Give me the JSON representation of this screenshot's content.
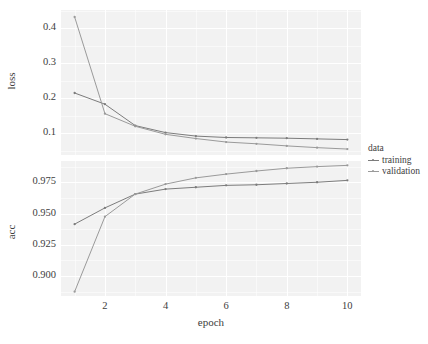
{
  "chart_data": {
    "type": "line",
    "title": "",
    "xlabel": "epoch",
    "x": [
      1,
      2,
      3,
      4,
      5,
      6,
      7,
      8,
      9,
      10
    ],
    "xlim": [
      0.55,
      10.45
    ],
    "xticks": [
      2,
      4,
      6,
      8,
      10
    ],
    "legend": {
      "title": "data",
      "position": "right",
      "entries": [
        "training",
        "validation"
      ]
    },
    "facets": [
      {
        "ylabel": "loss",
        "ylim": [
          0.038,
          0.452
        ],
        "yticks": [
          0.1,
          0.2,
          0.3,
          0.4
        ],
        "ytick_labels": [
          "0.1",
          "0.2",
          "0.3",
          "0.4"
        ],
        "series": [
          {
            "name": "training",
            "values": [
              0.215,
              0.183,
              0.122,
              0.102,
              0.092,
              0.088,
              0.087,
              0.086,
              0.084,
              0.082
            ]
          },
          {
            "name": "validation",
            "values": [
              0.432,
              0.156,
              0.12,
              0.097,
              0.085,
              0.075,
              0.07,
              0.064,
              0.059,
              0.055
            ]
          }
        ]
      },
      {
        "ylabel": "acc",
        "ylim": [
          0.884,
          0.992
        ],
        "yticks": [
          0.9,
          0.925,
          0.95,
          0.975
        ],
        "ytick_labels": [
          "0.900",
          "0.925",
          "0.950",
          "0.975"
        ],
        "series": [
          {
            "name": "training",
            "values": [
              0.9415,
              0.9545,
              0.9655,
              0.9695,
              0.971,
              0.9725,
              0.973,
              0.974,
              0.975,
              0.9765
            ]
          },
          {
            "name": "validation",
            "values": [
              0.8875,
              0.9475,
              0.9655,
              0.9735,
              0.9785,
              0.9815,
              0.984,
              0.9862,
              0.9875,
              0.9885
            ]
          }
        ]
      }
    ],
    "grid": {
      "major": true,
      "minor": true,
      "color": "#ffffff"
    },
    "colors": {
      "training": "#7c7c7c",
      "validation": "#9a9a9a",
      "panel_background": "#f2f2f2",
      "text": "#3d3d3d"
    }
  }
}
